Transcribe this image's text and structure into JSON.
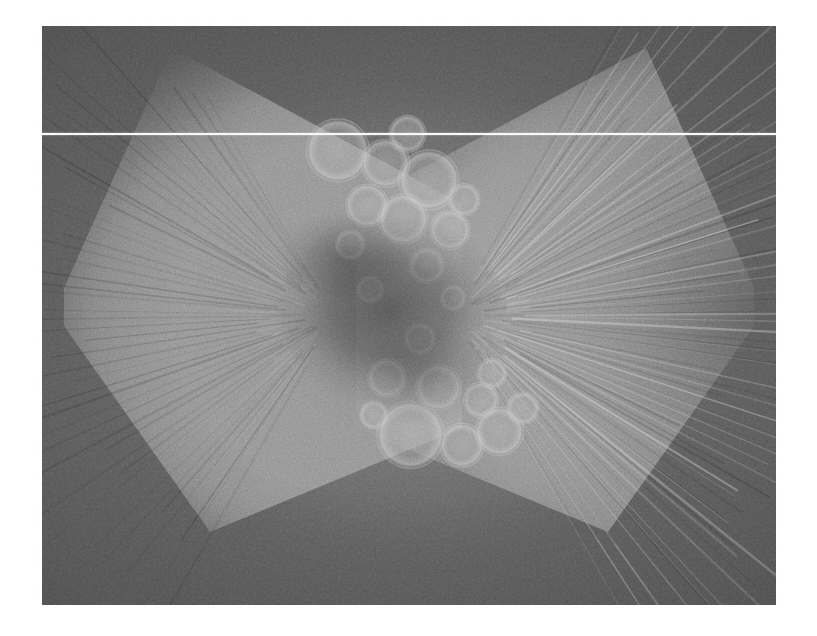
{
  "page": {
    "background_color": "#ffffff",
    "width": 817,
    "height": 636
  },
  "viewer": {
    "name": "scan-image-viewer",
    "image_region": {
      "x": 42,
      "y": 26,
      "width": 734,
      "height": 579
    },
    "background_color": "#5a5a5a",
    "modality_hint": "grayscale-noisy-reconstruction"
  },
  "annotations": {
    "scanline": {
      "name": "horizontal-scan-line",
      "y": 133,
      "color": "#f8f8f6",
      "thickness": 2
    }
  },
  "chart_data": {
    "type": "heatmap",
    "title": "",
    "xlabel": "",
    "ylabel": "",
    "colormap": "grayscale",
    "value_range": [
      0,
      255
    ],
    "background_level": 90,
    "bright_lobe_level": 150,
    "dark_core_level": 58,
    "grid": false,
    "legend": "none",
    "features": [
      {
        "label": "left-bright-lobe",
        "cx": 0.225,
        "cy": 0.5,
        "rx": 0.235,
        "ry": 0.43,
        "level": 152
      },
      {
        "label": "right-bright-lobe",
        "cx": 0.775,
        "cy": 0.5,
        "rx": 0.235,
        "ry": 0.43,
        "level": 152
      },
      {
        "label": "central-dark-core",
        "cx": 0.475,
        "cy": 0.49,
        "rx": 0.09,
        "ry": 0.11,
        "level": 58
      },
      {
        "label": "radial-streak-fan-left",
        "origin_x": 0.4,
        "origin_y": 0.5,
        "count": 46,
        "angle_from": 120,
        "angle_to": 240
      },
      {
        "label": "radial-streak-fan-right",
        "origin_x": 0.56,
        "origin_y": 0.5,
        "count": 46,
        "angle_from": -60,
        "angle_to": 60
      }
    ],
    "bubbles": [
      {
        "cx": 0.403,
        "cy": 0.215,
        "r": 0.043,
        "level": 132
      },
      {
        "cx": 0.468,
        "cy": 0.237,
        "r": 0.033,
        "level": 128
      },
      {
        "cx": 0.527,
        "cy": 0.266,
        "r": 0.041,
        "level": 134
      },
      {
        "cx": 0.498,
        "cy": 0.186,
        "r": 0.025,
        "level": 124
      },
      {
        "cx": 0.443,
        "cy": 0.31,
        "r": 0.029,
        "level": 130
      },
      {
        "cx": 0.492,
        "cy": 0.333,
        "r": 0.034,
        "level": 136
      },
      {
        "cx": 0.556,
        "cy": 0.352,
        "r": 0.027,
        "level": 126
      },
      {
        "cx": 0.575,
        "cy": 0.3,
        "r": 0.022,
        "level": 122
      },
      {
        "cx": 0.42,
        "cy": 0.378,
        "r": 0.02,
        "level": 120
      },
      {
        "cx": 0.524,
        "cy": 0.414,
        "r": 0.024,
        "level": 125
      },
      {
        "cx": 0.447,
        "cy": 0.455,
        "r": 0.018,
        "level": 118
      },
      {
        "cx": 0.515,
        "cy": 0.54,
        "r": 0.021,
        "level": 122
      },
      {
        "cx": 0.47,
        "cy": 0.608,
        "r": 0.026,
        "level": 128
      },
      {
        "cx": 0.54,
        "cy": 0.624,
        "r": 0.031,
        "level": 132
      },
      {
        "cx": 0.598,
        "cy": 0.646,
        "r": 0.024,
        "level": 126
      },
      {
        "cx": 0.613,
        "cy": 0.6,
        "r": 0.02,
        "level": 120
      },
      {
        "cx": 0.502,
        "cy": 0.706,
        "r": 0.046,
        "level": 138
      },
      {
        "cx": 0.572,
        "cy": 0.724,
        "r": 0.03,
        "level": 130
      },
      {
        "cx": 0.623,
        "cy": 0.7,
        "r": 0.033,
        "level": 134
      },
      {
        "cx": 0.655,
        "cy": 0.66,
        "r": 0.022,
        "level": 124
      },
      {
        "cx": 0.452,
        "cy": 0.672,
        "r": 0.019,
        "level": 118
      },
      {
        "cx": 0.56,
        "cy": 0.47,
        "r": 0.017,
        "level": 116
      }
    ]
  }
}
